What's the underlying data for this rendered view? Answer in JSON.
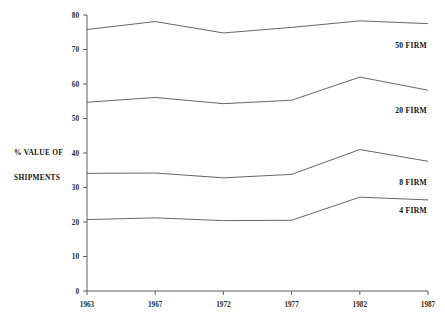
{
  "chart_data": {
    "type": "line",
    "title": "",
    "subtitle": "",
    "xlabel": "",
    "ylabel": "% VALUE OF SHIPMENTS",
    "ylabel_line1": "% VALUE OF",
    "ylabel_line2": "SHIPMENTS",
    "categories": [
      "1963",
      "1967",
      "1972",
      "1977",
      "1982",
      "1987"
    ],
    "x": [
      1963,
      1967,
      1972,
      1977,
      1982,
      1987
    ],
    "xlim": [
      1963,
      1987
    ],
    "ylim": [
      0,
      80
    ],
    "yticks": [
      0,
      10,
      20,
      30,
      40,
      50,
      60,
      70,
      80
    ],
    "ytick_labels": [
      "0",
      "10",
      "20",
      "30",
      "40",
      "50",
      "60",
      "70",
      "80"
    ],
    "xticks": [
      1963,
      1967,
      1972,
      1977,
      1982,
      1987
    ],
    "xtick_labels": [
      "1963",
      "1967",
      "1972",
      "1977",
      "1982",
      "1987"
    ],
    "grid": false,
    "legend_position": "right-inline",
    "series": [
      {
        "name": "50 FIRM",
        "label": "50 FIRM",
        "color": "#555555",
        "values": [
          75.8,
          78.1,
          74.8,
          76.4,
          78.3,
          77.5
        ],
        "label_value": 70.5
      },
      {
        "name": "20 FIRM",
        "label": "20 FIRM",
        "color": "#555555",
        "values": [
          54.7,
          56.1,
          54.3,
          55.3,
          62.0,
          58.2
        ],
        "label_value": 51.5
      },
      {
        "name": "8 FIRM",
        "label": "8 FIRM",
        "color": "#555555",
        "values": [
          34.1,
          34.2,
          32.8,
          33.8,
          41.0,
          37.6
        ],
        "label_value": 30.8
      },
      {
        "name": "4 FIRM",
        "label": "4 FIRM",
        "color": "#555555",
        "values": [
          20.7,
          21.2,
          20.4,
          20.5,
          27.2,
          26.4
        ],
        "label_value": 22.7
      }
    ]
  },
  "plot_geometry": {
    "left": 87,
    "right": 428,
    "top": 15,
    "bottom": 291
  }
}
